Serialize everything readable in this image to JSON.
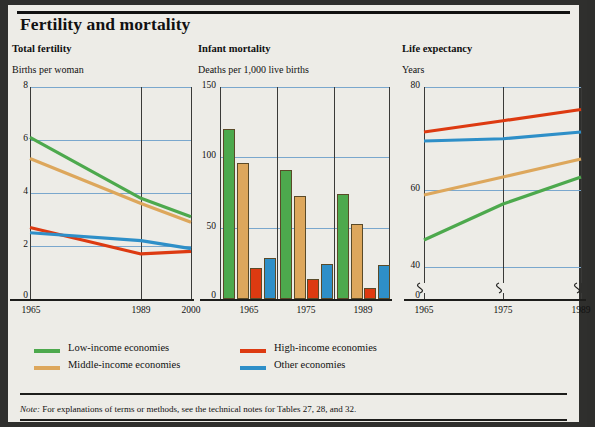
{
  "figure": {
    "title": "Fertility and mortality",
    "note_prefix": "Note:",
    "note_text": " For explanations of terms or methods, see the technical notes for Tables 27, 28, and 32."
  },
  "colors": {
    "low_income": "#4da94d",
    "middle_income": "#dda75c",
    "high_income": "#dd3a11",
    "other": "#2e8fc8",
    "gridline": "#7aa7cd",
    "axis": "#1d1d1b",
    "page_bg": "#edece7",
    "surround": "#2f2f2d"
  },
  "legend": {
    "items": [
      {
        "label": "Low-income economies",
        "color": "#4da94d",
        "key": "low_income"
      },
      {
        "label": "Middle-income economies",
        "color": "#dda75c",
        "key": "middle_income"
      },
      {
        "label": "High-income economies",
        "color": "#dd3a11",
        "key": "high_income"
      },
      {
        "label": "Other economies",
        "color": "#2e8fc8",
        "key": "other"
      }
    ]
  },
  "chart_data": [
    {
      "id": "total-fertility",
      "type": "line",
      "title": "Total fertility",
      "ylabel": "Births per woman",
      "xlabel": "",
      "x": [
        "1965",
        "1989",
        "2000"
      ],
      "xticks": [
        "1965",
        "1989",
        "2000"
      ],
      "yticks": [
        "8",
        "6",
        "4",
        "2",
        "0"
      ],
      "ylim": [
        0,
        8
      ],
      "grid": true,
      "series": [
        {
          "name": "Low-income economies",
          "color": "#4da94d",
          "values": [
            6.1,
            3.8,
            3.1
          ]
        },
        {
          "name": "Middle-income economies",
          "color": "#dda75c",
          "values": [
            5.3,
            3.6,
            2.9
          ]
        },
        {
          "name": "High-income economies",
          "color": "#dd3a11",
          "values": [
            2.7,
            1.7,
            1.8
          ]
        },
        {
          "name": "Other economies",
          "color": "#2e8fc8",
          "values": [
            2.5,
            2.2,
            1.9
          ]
        }
      ]
    },
    {
      "id": "infant-mortality",
      "type": "bar",
      "title": "Infant mortality",
      "ylabel": "Deaths per 1,000 live births",
      "xlabel": "",
      "categories": [
        "1965",
        "1975",
        "1989"
      ],
      "yticks": [
        "150",
        "100",
        "50",
        "0"
      ],
      "ylim": [
        0,
        150
      ],
      "grid": true,
      "series": [
        {
          "name": "Low-income economies",
          "color": "#4da94d",
          "values": [
            120,
            91,
            74
          ]
        },
        {
          "name": "Middle-income economies",
          "color": "#dda75c",
          "values": [
            96,
            73,
            53
          ]
        },
        {
          "name": "High-income economies",
          "color": "#dd3a11",
          "values": [
            22,
            14,
            8
          ]
        },
        {
          "name": "Other economies",
          "color": "#2e8fc8",
          "values": [
            29,
            25,
            24
          ]
        }
      ]
    },
    {
      "id": "life-expectancy",
      "type": "line",
      "title": "Life expectancy",
      "ylabel": "Years",
      "xlabel": "",
      "x": [
        "1965",
        "1975",
        "1989"
      ],
      "xticks": [
        "1965",
        "1975",
        "1989"
      ],
      "yticks": [
        "80",
        "60",
        "40",
        "0"
      ],
      "ylim": [
        0,
        80
      ],
      "axis_break": true,
      "grid": true,
      "series": [
        {
          "name": "Low-income economies",
          "color": "#4da94d",
          "values": [
            46,
            54,
            60
          ]
        },
        {
          "name": "Middle-income economies",
          "color": "#dda75c",
          "values": [
            56,
            60,
            64
          ]
        },
        {
          "name": "High-income economies",
          "color": "#dd3a11",
          "values": [
            70,
            72.5,
            75
          ]
        },
        {
          "name": "Other economies",
          "color": "#2e8fc8",
          "values": [
            68,
            68.5,
            70
          ]
        }
      ]
    }
  ]
}
